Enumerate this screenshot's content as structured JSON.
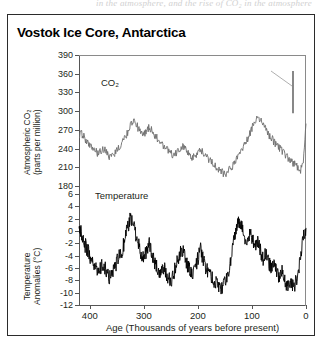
{
  "page": {
    "bleed_text": "in the atmosphere, and the rise of CO₂ in the atmosphere"
  },
  "figure": {
    "title": "Vostok Ice Core, Antarctica"
  },
  "axes": {
    "co2": {
      "title_line1": "Atmospheric CO₂",
      "title_line2": "(parts per million)",
      "ticks": [
        "390",
        "360",
        "330",
        "300",
        "270",
        "240",
        "210",
        "180"
      ],
      "min": 180,
      "max": 390
    },
    "temperature": {
      "title_line1": "Temperature",
      "title_line2": "Anomalies (°C)",
      "ticks": [
        "6",
        "4",
        "2",
        "0",
        "-2",
        "-4",
        "-6",
        "-8",
        "-10",
        "-12"
      ],
      "min": -12,
      "max": 6
    },
    "x": {
      "title": "Age (Thousands of years before present)",
      "ticks": [
        "400",
        "300",
        "200",
        "100",
        "0"
      ],
      "min": 0,
      "max": 420,
      "reversed": true
    }
  },
  "series_labels": {
    "co2": "CO₂",
    "temperature": "Temperature"
  },
  "colors": {
    "co2_line": "#6d6d6d",
    "temperature_line": "#000000",
    "axis": "#555555",
    "frame": "#2b2b2b",
    "text": "#231f20",
    "background": "#ffffff"
  },
  "chart_data": {
    "type": "line",
    "title": "Vostok Ice Core, Antarctica",
    "subtitle": "",
    "xlabel": "Age (Thousands of years before present)",
    "ylabel": "Atmospheric CO2 (parts per million) / Temperature Anomalies (degrees C)",
    "xlim": [
      420,
      0
    ],
    "x_reversed": true,
    "grid": false,
    "legend_position": "inline-annotation",
    "panels": [
      {
        "name": "Atmospheric CO2",
        "ylabel": "Atmospheric CO₂ (parts per million)",
        "ylim": [
          180,
          390
        ],
        "yticks": [
          180,
          210,
          240,
          270,
          300,
          330,
          360,
          390
        ],
        "units": "ppm",
        "annotation": "CO₂",
        "modern_spike": {
          "x": 0,
          "value_top": 390,
          "value_bottom": 300,
          "note": "vertical bar at present day showing industrial-era CO₂ rise",
          "leader_line": true
        },
        "x": [
          420,
          415,
          410,
          405,
          400,
          395,
          390,
          385,
          380,
          375,
          370,
          365,
          360,
          355,
          350,
          345,
          340,
          335,
          330,
          325,
          320,
          315,
          310,
          305,
          300,
          295,
          290,
          285,
          280,
          275,
          270,
          265,
          260,
          255,
          250,
          245,
          240,
          235,
          230,
          225,
          220,
          215,
          210,
          205,
          200,
          195,
          190,
          185,
          180,
          175,
          170,
          165,
          160,
          155,
          150,
          145,
          140,
          135,
          130,
          125,
          120,
          115,
          110,
          105,
          100,
          95,
          90,
          85,
          80,
          75,
          70,
          65,
          60,
          55,
          50,
          45,
          40,
          35,
          30,
          25,
          20,
          15,
          10,
          5,
          0
        ],
        "values": [
          262,
          264,
          258,
          250,
          246,
          240,
          236,
          232,
          236,
          240,
          234,
          228,
          226,
          232,
          238,
          244,
          250,
          258,
          266,
          278,
          284,
          280,
          272,
          266,
          262,
          268,
          274,
          270,
          262,
          256,
          250,
          246,
          240,
          236,
          232,
          228,
          232,
          238,
          244,
          240,
          234,
          228,
          224,
          228,
          234,
          238,
          232,
          226,
          222,
          218,
          214,
          210,
          206,
          202,
          198,
          202,
          208,
          214,
          220,
          228,
          236,
          244,
          252,
          262,
          272,
          284,
          290,
          286,
          280,
          272,
          264,
          258,
          252,
          246,
          242,
          238,
          232,
          226,
          222,
          218,
          214,
          210,
          206,
          216,
          280
        ]
      },
      {
        "name": "Temperature Anomalies",
        "ylabel": "Temperature Anomalies (°C)",
        "ylim": [
          -12,
          6
        ],
        "yticks": [
          -12,
          -10,
          -8,
          -6,
          -4,
          -2,
          0,
          2,
          4,
          6
        ],
        "units": "degrees C",
        "annotation": "Temperature",
        "x": [
          420,
          415,
          410,
          405,
          400,
          395,
          390,
          385,
          380,
          375,
          370,
          365,
          360,
          355,
          350,
          345,
          340,
          335,
          330,
          325,
          320,
          315,
          310,
          305,
          300,
          295,
          290,
          285,
          280,
          275,
          270,
          265,
          260,
          255,
          250,
          245,
          240,
          235,
          230,
          225,
          220,
          215,
          210,
          205,
          200,
          195,
          190,
          185,
          180,
          175,
          170,
          165,
          160,
          155,
          150,
          145,
          140,
          135,
          130,
          125,
          120,
          115,
          110,
          105,
          100,
          95,
          90,
          85,
          80,
          75,
          70,
          65,
          60,
          55,
          50,
          45,
          40,
          35,
          30,
          25,
          20,
          15,
          10,
          5,
          0
        ],
        "values": [
          0.5,
          -0.5,
          -2.0,
          -3.0,
          -4.0,
          -5.0,
          -6.0,
          -6.5,
          -6.0,
          -5.5,
          -6.5,
          -7.5,
          -7.0,
          -6.0,
          -5.0,
          -4.0,
          -3.0,
          -1.5,
          0.5,
          2.0,
          1.0,
          -0.5,
          -2.0,
          -3.5,
          -4.5,
          -3.0,
          -2.0,
          -3.5,
          -5.0,
          -6.0,
          -6.5,
          -5.5,
          -6.5,
          -7.5,
          -8.0,
          -7.0,
          -5.5,
          -4.0,
          -2.5,
          -4.0,
          -5.5,
          -6.5,
          -7.5,
          -6.0,
          -4.5,
          -3.0,
          -4.5,
          -6.0,
          -7.0,
          -7.5,
          -8.0,
          -8.5,
          -9.0,
          -9.5,
          -8.5,
          -7.0,
          -5.0,
          -2.5,
          0.0,
          2.0,
          1.0,
          -0.5,
          -1.5,
          -0.5,
          -1.0,
          -2.5,
          -1.5,
          -3.0,
          -4.5,
          -3.5,
          -5.0,
          -6.0,
          -5.0,
          -6.5,
          -7.5,
          -6.5,
          -8.0,
          -9.0,
          -8.0,
          -9.0,
          -8.5,
          -7.0,
          -4.0,
          -1.0,
          0.5
        ]
      }
    ]
  }
}
